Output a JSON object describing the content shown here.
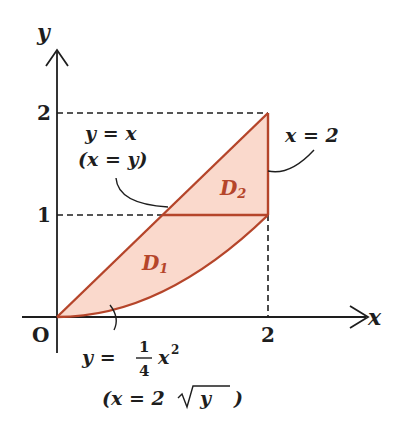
{
  "figure": {
    "axes": {
      "x_label": "x",
      "y_label": "y",
      "origin_label": "O",
      "x_ticks": [
        "2"
      ],
      "y_ticks": [
        "1",
        "2"
      ]
    },
    "regions": {
      "d1": {
        "letter": "D",
        "sub": "1"
      },
      "d2": {
        "letter": "D",
        "sub": "2"
      }
    },
    "annotations": {
      "line_eq": "y = x",
      "line_eq_inv": "(x = y)",
      "vertical_eq": "x = 2",
      "curve_lhs": "y =",
      "curve_num": "1",
      "curve_den": "4",
      "curve_rhs": "x",
      "curve_exp": "2",
      "curve_inv_left": "(x = 2",
      "curve_inv_rad": "y",
      "curve_inv_right": ")"
    },
    "colors": {
      "fill": "#fad9cc",
      "stroke": "#b5452a",
      "axis": "#1e1e1e"
    }
  }
}
